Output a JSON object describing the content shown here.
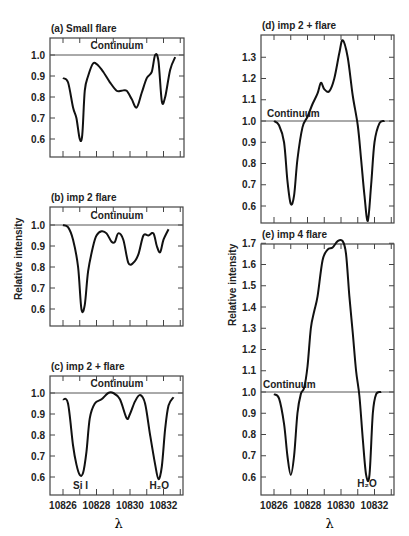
{
  "figure": {
    "ylabel": "Relative intensity",
    "xlabel": "λ",
    "continuum_label": "Continuum",
    "line_labels": {
      "si": "Si I",
      "h2o": "H₂O"
    }
  },
  "chart_data": [
    {
      "type": "line",
      "panel": "a",
      "title": "(a)  Small flare",
      "xlabel": "λ",
      "ylabel": "Relative intensity",
      "xlim": [
        10825.2,
        10833.2
      ],
      "ylim": [
        0.52,
        1.08
      ],
      "yticks": [
        0.6,
        0.7,
        0.8,
        0.9,
        1.0
      ],
      "annotations": [
        "Continuum"
      ],
      "series": [
        {
          "name": "Small flare",
          "x": [
            10826.0,
            10826.3,
            10826.6,
            10826.8,
            10827.0,
            10827.15,
            10827.3,
            10827.5,
            10827.8,
            10828.1,
            10828.4,
            10828.8,
            10829.2,
            10829.5,
            10829.8,
            10830.1,
            10830.4,
            10830.7,
            10831.0,
            10831.3,
            10831.5,
            10831.7,
            10831.9,
            10832.1,
            10832.4,
            10832.7
          ],
          "y": [
            0.89,
            0.87,
            0.75,
            0.7,
            0.6,
            0.62,
            0.83,
            0.9,
            0.96,
            0.95,
            0.92,
            0.87,
            0.83,
            0.83,
            0.83,
            0.79,
            0.75,
            0.82,
            0.89,
            0.92,
            1.0,
            0.97,
            0.78,
            0.8,
            0.93,
            0.99
          ]
        }
      ]
    },
    {
      "type": "line",
      "panel": "b",
      "title": "(b)  imp 2     flare",
      "xlabel": "λ",
      "ylabel": "Relative intensity",
      "xlim": [
        10825.2,
        10833.2
      ],
      "ylim": [
        0.52,
        1.08
      ],
      "yticks": [
        0.6,
        0.7,
        0.8,
        0.9,
        1.0
      ],
      "annotations": [
        "Continuum"
      ],
      "series": [
        {
          "name": "imp 2 flare",
          "x": [
            10826.0,
            10826.3,
            10826.6,
            10826.9,
            10827.1,
            10827.3,
            10827.5,
            10827.8,
            10828.0,
            10828.3,
            10828.6,
            10828.9,
            10829.1,
            10829.3,
            10829.6,
            10829.9,
            10830.2,
            10830.5,
            10830.8,
            10831.1,
            10831.4,
            10831.6,
            10831.8,
            10832.0,
            10832.3
          ],
          "y": [
            1.0,
            0.99,
            0.93,
            0.8,
            0.6,
            0.62,
            0.78,
            0.9,
            0.95,
            0.97,
            0.96,
            0.92,
            0.92,
            0.96,
            0.93,
            0.82,
            0.82,
            0.86,
            0.95,
            0.95,
            0.96,
            0.9,
            0.87,
            0.93,
            0.98
          ]
        }
      ]
    },
    {
      "type": "line",
      "panel": "c",
      "title": "(c)  imp 2 +   flare",
      "xlabel": "λ",
      "ylabel": "Relative intensity",
      "xlim": [
        10825.2,
        10833.2
      ],
      "ylim": [
        0.52,
        1.08
      ],
      "yticks": [
        0.6,
        0.7,
        0.8,
        0.9,
        1.0
      ],
      "xticks": [
        10826,
        10828,
        10830,
        10832
      ],
      "annotations": [
        "Continuum",
        "Si I",
        "H₂O"
      ],
      "series": [
        {
          "name": "imp 2+ flare",
          "x": [
            10826.0,
            10826.3,
            10826.6,
            10826.8,
            10827.0,
            10827.2,
            10827.4,
            10827.6,
            10827.9,
            10828.3,
            10828.7,
            10829.0,
            10829.4,
            10829.8,
            10830.0,
            10830.3,
            10830.6,
            10830.9,
            10831.2,
            10831.5,
            10831.7,
            10831.9,
            10832.1,
            10832.3,
            10832.6
          ],
          "y": [
            0.97,
            0.95,
            0.75,
            0.66,
            0.61,
            0.62,
            0.72,
            0.88,
            0.95,
            0.97,
            1.0,
            1.0,
            0.97,
            0.88,
            0.9,
            0.96,
            0.99,
            0.95,
            0.8,
            0.66,
            0.59,
            0.65,
            0.83,
            0.94,
            0.98
          ]
        }
      ]
    },
    {
      "type": "line",
      "panel": "d",
      "title": "(d)  imp 2 +  flare",
      "xlabel": "λ",
      "ylabel": "Relative intensity",
      "xlim": [
        10825.2,
        10833.2
      ],
      "ylim": [
        0.5,
        1.4
      ],
      "yticks": [
        0.6,
        0.7,
        0.8,
        0.9,
        1.0,
        1.1,
        1.2,
        1.3
      ],
      "annotations": [
        "Continuum"
      ],
      "series": [
        {
          "name": "imp 2+ flare",
          "x": [
            10826.0,
            10826.3,
            10826.6,
            10826.8,
            10827.0,
            10827.2,
            10827.4,
            10827.7,
            10828.0,
            10828.3,
            10828.6,
            10828.8,
            10829.0,
            10829.3,
            10829.6,
            10829.9,
            10830.1,
            10830.4,
            10830.7,
            10831.0,
            10831.2,
            10831.4,
            10831.6,
            10831.8,
            10832.0,
            10832.3,
            10832.6
          ],
          "y": [
            1.0,
            0.98,
            0.9,
            0.72,
            0.61,
            0.65,
            0.82,
            0.97,
            1.02,
            1.08,
            1.13,
            1.18,
            1.15,
            1.14,
            1.2,
            1.32,
            1.38,
            1.3,
            1.12,
            0.98,
            0.82,
            0.65,
            0.53,
            0.7,
            0.9,
            0.99,
            1.0
          ]
        }
      ]
    },
    {
      "type": "line",
      "panel": "e",
      "title": "(e)  imp 4       flare",
      "xlabel": "λ",
      "ylabel": "Relative intensity",
      "xlim": [
        10825.2,
        10833.2
      ],
      "ylim": [
        0.52,
        1.78
      ],
      "yticks": [
        0.6,
        0.7,
        0.8,
        0.9,
        1.0,
        1.1,
        1.2,
        1.3,
        1.4,
        1.5,
        1.6,
        1.7
      ],
      "xticks": [
        10826,
        10828,
        10830,
        10832
      ],
      "annotations": [
        "Continuum",
        "H₂O"
      ],
      "series": [
        {
          "name": "imp 4 flare",
          "x": [
            10826.0,
            10826.3,
            10826.6,
            10826.8,
            10827.0,
            10827.2,
            10827.4,
            10827.6,
            10827.8,
            10828.0,
            10828.2,
            10828.4,
            10828.6,
            10828.9,
            10829.2,
            10829.5,
            10829.8,
            10830.1,
            10830.3,
            10830.5,
            10830.7,
            10830.9,
            10831.1,
            10831.3,
            10831.5,
            10831.7,
            10831.9,
            10832.1,
            10832.4
          ],
          "y": [
            0.99,
            0.97,
            0.85,
            0.7,
            0.61,
            0.7,
            0.9,
            0.99,
            1.02,
            1.12,
            1.3,
            1.38,
            1.45,
            1.62,
            1.67,
            1.68,
            1.71,
            1.71,
            1.65,
            1.45,
            1.28,
            1.1,
            0.98,
            0.78,
            0.61,
            0.61,
            0.9,
            0.99,
            1.0
          ]
        }
      ]
    }
  ]
}
